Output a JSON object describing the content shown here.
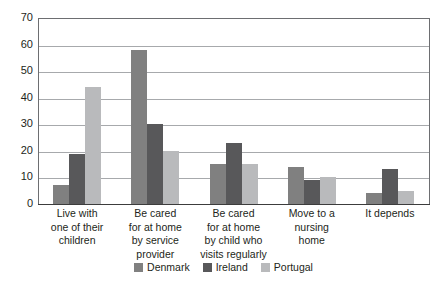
{
  "chart_data": {
    "type": "bar",
    "title": "",
    "subtitle": "",
    "xlabel": "",
    "ylabel": "",
    "ylim": [
      0,
      70
    ],
    "y_ticks": [
      0,
      10,
      20,
      30,
      40,
      50,
      60,
      70
    ],
    "grid": true,
    "legend_position": "bottom",
    "categories": [
      "Live with one of their children",
      "Be cared for at home by service provider",
      "Be cared for at home by child who visits  regularly",
      "Move to a nursing home",
      "It depends"
    ],
    "category_lines": [
      [
        "Live with",
        "one of their",
        "children"
      ],
      [
        "Be cared",
        "for at home",
        "by service",
        "provider"
      ],
      [
        "Be cared",
        "for at home",
        "by child who",
        "visits  regularly"
      ],
      [
        "Move to a",
        "nursing",
        "home"
      ],
      [
        "It depends"
      ]
    ],
    "series": [
      {
        "name": "Denmark",
        "color": "#808080",
        "values": [
          7,
          58,
          15,
          14,
          4
        ]
      },
      {
        "name": "Ireland",
        "color": "#58585a",
        "values": [
          19,
          30,
          23,
          9,
          13
        ]
      },
      {
        "name": "Portugal",
        "color": "#b9babc",
        "values": [
          44,
          20,
          15,
          10,
          5
        ]
      }
    ]
  },
  "legend": {
    "items": [
      {
        "label": "Denmark",
        "color": "#808080"
      },
      {
        "label": "Ireland",
        "color": "#58585a"
      },
      {
        "label": "Portugal",
        "color": "#b9babc"
      }
    ]
  },
  "axis": {
    "y_tick_labels": [
      "70",
      "60",
      "50",
      "40",
      "30",
      "20",
      "10",
      "0"
    ]
  }
}
